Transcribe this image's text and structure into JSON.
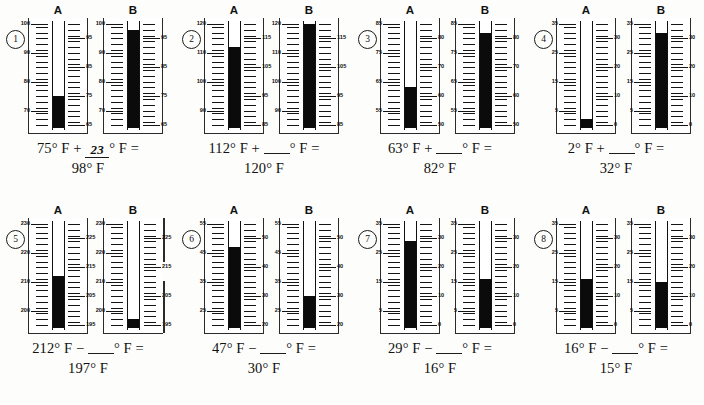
{
  "worksheet": {
    "title": "Thermometer addition and subtraction practice",
    "column_labels": {
      "a": "A",
      "b": "B"
    },
    "degree_symbol": "°",
    "unit": "F"
  },
  "problems": [
    {
      "number": "1",
      "row": 1,
      "thermometers": {
        "a": {
          "label": "A",
          "left_labels": [
            "100",
            "90",
            "80",
            "70"
          ],
          "right_labels": [
            "95",
            "85",
            "75",
            "65"
          ],
          "scale_min": 65,
          "scale_max": 100,
          "reading": 75
        },
        "b": {
          "label": "B",
          "left_labels": [
            "100",
            "90",
            "80",
            "70"
          ],
          "right_labels": [
            "95",
            "85",
            "75",
            "65"
          ],
          "scale_min": 65,
          "scale_max": 100,
          "reading": 98
        }
      },
      "equation": {
        "operand1": "75",
        "operator": "+",
        "blank_value": "23",
        "blank_filled": true,
        "result": "98"
      }
    },
    {
      "number": "2",
      "row": 1,
      "thermometers": {
        "a": {
          "label": "A",
          "left_labels": [
            "120",
            "110",
            "100",
            "90"
          ],
          "right_labels": [
            "115",
            "105",
            "95",
            "85"
          ],
          "scale_min": 85,
          "scale_max": 120,
          "reading": 112
        },
        "b": {
          "label": "B",
          "left_labels": [
            "120",
            "110",
            "100",
            "90"
          ],
          "right_labels": [
            "115",
            "105",
            "95",
            "85"
          ],
          "scale_min": 85,
          "scale_max": 120,
          "reading": 120
        }
      },
      "equation": {
        "operand1": "112",
        "operator": "+",
        "blank_value": "",
        "blank_filled": false,
        "result": "120"
      }
    },
    {
      "number": "3",
      "row": 1,
      "thermometers": {
        "a": {
          "label": "A",
          "left_labels": [
            "85",
            "75",
            "65",
            "55"
          ],
          "right_labels": [
            "80",
            "70",
            "60",
            "50"
          ],
          "scale_min": 50,
          "scale_max": 85,
          "reading": 63
        },
        "b": {
          "label": "B",
          "left_labels": [
            "85",
            "75",
            "65",
            "55"
          ],
          "right_labels": [
            "80",
            "70",
            "60",
            "50"
          ],
          "scale_min": 50,
          "scale_max": 85,
          "reading": 82
        }
      },
      "equation": {
        "operand1": "63",
        "operator": "+",
        "blank_value": "",
        "blank_filled": false,
        "result": "82"
      }
    },
    {
      "number": "4",
      "row": 1,
      "thermometers": {
        "a": {
          "label": "A",
          "left_labels": [
            "35",
            "25",
            "15",
            "5"
          ],
          "right_labels": [
            "30",
            "20",
            "10",
            "0"
          ],
          "scale_min": 0,
          "scale_max": 35,
          "reading": 2
        },
        "b": {
          "label": "B",
          "left_labels": [
            "35",
            "25",
            "15",
            "5"
          ],
          "right_labels": [
            "30",
            "20",
            "10",
            "0"
          ],
          "scale_min": 0,
          "scale_max": 35,
          "reading": 32
        }
      },
      "equation": {
        "operand1": "2",
        "operator": "+",
        "blank_value": "",
        "blank_filled": false,
        "result": "32"
      }
    },
    {
      "number": "5",
      "row": 2,
      "thermometers": {
        "a": {
          "label": "A",
          "left_labels": [
            "230",
            "220",
            "210",
            "200"
          ],
          "right_labels": [
            "225",
            "215",
            "205",
            "195"
          ],
          "scale_min": 195,
          "scale_max": 230,
          "reading": 212
        },
        "b": {
          "label": "B",
          "left_labels": [
            "230",
            "220",
            "210",
            "200"
          ],
          "right_labels": [
            "225",
            "215",
            "205",
            "195"
          ],
          "scale_min": 195,
          "scale_max": 230,
          "reading": 197
        }
      },
      "equation": {
        "operand1": "212",
        "operator": "−",
        "blank_value": "",
        "blank_filled": false,
        "result": "197"
      }
    },
    {
      "number": "6",
      "row": 2,
      "thermometers": {
        "a": {
          "label": "A",
          "left_labels": [
            "55",
            "45",
            "35",
            "25"
          ],
          "right_labels": [
            "50",
            "40",
            "30",
            "20"
          ],
          "scale_min": 20,
          "scale_max": 55,
          "reading": 47
        },
        "b": {
          "label": "B",
          "left_labels": [
            "55",
            "45",
            "35",
            "25"
          ],
          "right_labels": [
            "50",
            "40",
            "30",
            "20"
          ],
          "scale_min": 20,
          "scale_max": 55,
          "reading": 30
        }
      },
      "equation": {
        "operand1": "47",
        "operator": "−",
        "blank_value": "",
        "blank_filled": false,
        "result": "30"
      }
    },
    {
      "number": "7",
      "row": 2,
      "thermometers": {
        "a": {
          "label": "A",
          "left_labels": [
            "35",
            "25",
            "15",
            "5"
          ],
          "right_labels": [
            "30",
            "20",
            "10",
            "0"
          ],
          "scale_min": 0,
          "scale_max": 35,
          "reading": 29
        },
        "b": {
          "label": "B",
          "left_labels": [
            "35",
            "25",
            "15",
            "5"
          ],
          "right_labels": [
            "30",
            "20",
            "10",
            "0"
          ],
          "scale_min": 0,
          "scale_max": 35,
          "reading": 16
        }
      },
      "equation": {
        "operand1": "29",
        "operator": "−",
        "blank_value": "",
        "blank_filled": false,
        "result": "16"
      }
    },
    {
      "number": "8",
      "row": 2,
      "thermometers": {
        "a": {
          "label": "A",
          "left_labels": [
            "35",
            "25",
            "15",
            "5"
          ],
          "right_labels": [
            "30",
            "20",
            "10",
            "0"
          ],
          "scale_min": 0,
          "scale_max": 35,
          "reading": 16
        },
        "b": {
          "label": "B",
          "left_labels": [
            "35",
            "25",
            "15",
            "5"
          ],
          "right_labels": [
            "30",
            "20",
            "10",
            "0"
          ],
          "scale_min": 0,
          "scale_max": 35,
          "reading": 15
        }
      },
      "equation": {
        "operand1": "16",
        "operator": "−",
        "blank_value": "",
        "blank_filled": false,
        "result": "15"
      }
    }
  ]
}
